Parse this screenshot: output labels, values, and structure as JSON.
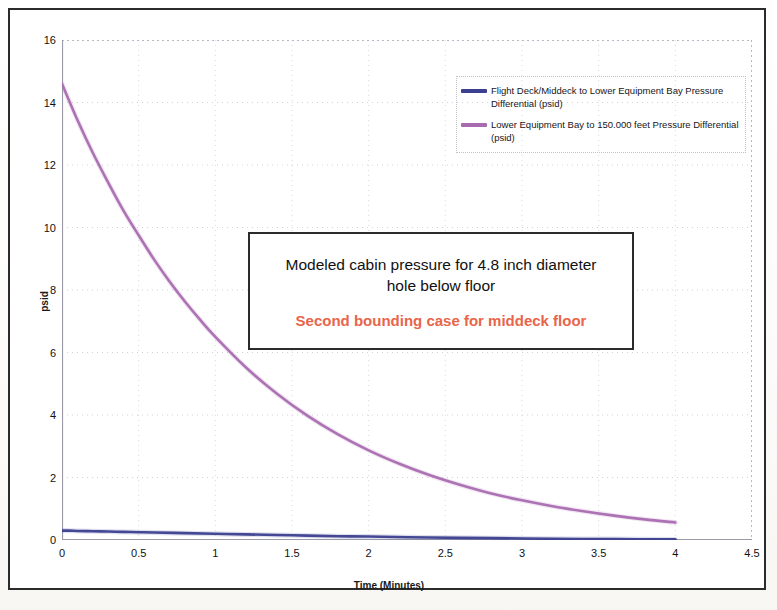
{
  "chart_data": {
    "type": "line",
    "title": "",
    "xlabel": "Time (Minutes)",
    "ylabel": "psid",
    "xlim": [
      0,
      4.5
    ],
    "ylim": [
      0,
      16
    ],
    "xticks": [
      "0",
      "0.5",
      "1",
      "1.5",
      "2",
      "2.5",
      "3",
      "3.5",
      "4",
      "4.5"
    ],
    "xtick_values": [
      0,
      0.5,
      1,
      1.5,
      2,
      2.5,
      3,
      3.5,
      4,
      4.5
    ],
    "yticks": [
      "0",
      "2",
      "4",
      "6",
      "8",
      "10",
      "12",
      "14",
      "16"
    ],
    "ytick_values": [
      0,
      2,
      4,
      6,
      8,
      10,
      12,
      14,
      16
    ],
    "grid": "dotted-faint-both-axes",
    "legend_position": "top-right-inside",
    "series": [
      {
        "name": "Flight Deck/Middeck to Lower Equipment Bay Pressure Differential (psid)",
        "color": "#3b3f8f",
        "x": [
          0,
          0.05,
          0.1,
          0.2,
          0.3,
          0.4,
          0.5,
          0.6,
          0.8,
          1.0,
          1.2,
          1.5,
          1.8,
          2.0,
          2.4,
          2.8,
          3.2,
          3.6,
          4.0
        ],
        "values": [
          0.3,
          0.3,
          0.29,
          0.28,
          0.27,
          0.26,
          0.25,
          0.24,
          0.22,
          0.2,
          0.18,
          0.15,
          0.12,
          0.11,
          0.08,
          0.06,
          0.04,
          0.03,
          0.02
        ]
      },
      {
        "name": "Lower Equipment Bay to 150.000 feet Pressure Differential (psid)",
        "color": "#a96bb0",
        "x": [
          0,
          0.1,
          0.2,
          0.3,
          0.4,
          0.5,
          0.6,
          0.7,
          0.8,
          0.9,
          1.0,
          1.2,
          1.4,
          1.6,
          1.8,
          2.0,
          2.2,
          2.4,
          2.6,
          2.8,
          3.0,
          3.2,
          3.4,
          3.6,
          3.8,
          4.0
        ],
        "values": [
          14.6,
          13.45,
          12.4,
          11.45,
          10.55,
          9.75,
          8.98,
          8.28,
          7.64,
          7.05,
          6.5,
          5.52,
          4.69,
          3.98,
          3.38,
          2.87,
          2.44,
          2.07,
          1.76,
          1.49,
          1.27,
          1.08,
          0.92,
          0.78,
          0.66,
          0.56
        ]
      }
    ]
  },
  "legend": {
    "entries": [
      {
        "label": "Flight Deck/Middeck to Lower Equipment Bay Pressure Differential (psid)",
        "color": "#3b3f8f"
      },
      {
        "label": "Lower Equipment Bay to 150.000 feet Pressure Differential (psid)",
        "color": "#a96bb0"
      }
    ]
  },
  "annotation": {
    "main_text": "Modeled cabin pressure for 4.8 inch diameter hole below floor",
    "sub_text": "Second bounding case for middeck floor",
    "sub_color": "#e8654a"
  },
  "axes": {
    "x_title": "Time (Minutes)",
    "y_title": "psid"
  }
}
